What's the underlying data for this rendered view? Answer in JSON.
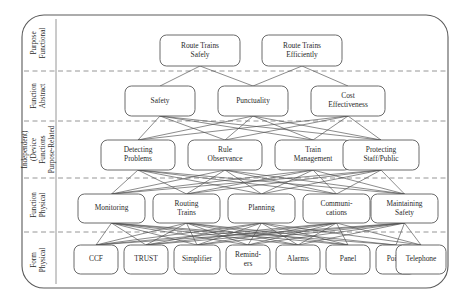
{
  "diagram": {
    "type": "abstraction-hierarchy",
    "frame": {
      "x": 22,
      "y": 15,
      "width": 426,
      "height": 273,
      "radius": 22
    },
    "axis_separator_x": 56,
    "level_dividers_y": [
      71,
      121,
      178,
      232
    ],
    "levels": [
      {
        "id": "functional-purpose",
        "label": "Functional Purpose",
        "label_lines": [
          "Functional",
          "Purpose"
        ],
        "band_top": 15,
        "band_bottom": 71
      },
      {
        "id": "abstract-function",
        "label": "Abstract Function",
        "label_lines": [
          "Abstract",
          "Function"
        ],
        "band_top": 71,
        "band_bottom": 121
      },
      {
        "id": "purpose-related-functions",
        "label": "Purpose-Related Functions (Device Independent)",
        "label_lines": [
          "Purpose-Related",
          "Functions",
          "(Device",
          "Independent)"
        ],
        "band_top": 121,
        "band_bottom": 178
      },
      {
        "id": "physical-function",
        "label": "Physical Function",
        "label_lines": [
          "Physical",
          "Function"
        ],
        "band_top": 178,
        "band_bottom": 232
      },
      {
        "id": "physical-form",
        "label": "Physical Form",
        "label_lines": [
          "Physical",
          "Form"
        ],
        "band_top": 232,
        "band_bottom": 288
      }
    ],
    "nodes": [
      {
        "id": "route-trains-safely",
        "level": 0,
        "lines": [
          "Route Trains",
          "Safely"
        ],
        "x": 160,
        "y": 35,
        "w": 80,
        "h": 31
      },
      {
        "id": "route-trains-efficiently",
        "level": 0,
        "lines": [
          "Route Trains",
          "Efficiently"
        ],
        "x": 262,
        "y": 35,
        "w": 80,
        "h": 31
      },
      {
        "id": "safety",
        "level": 1,
        "lines": [
          "Safety"
        ],
        "x": 125,
        "y": 86,
        "w": 70,
        "h": 30
      },
      {
        "id": "punctuality",
        "level": 1,
        "lines": [
          "Punctuality"
        ],
        "x": 218,
        "y": 86,
        "w": 70,
        "h": 30
      },
      {
        "id": "cost-effectiveness",
        "level": 1,
        "lines": [
          "Cost",
          "Effectiveness"
        ],
        "x": 311,
        "y": 86,
        "w": 74,
        "h": 30
      },
      {
        "id": "detecting-problems",
        "level": 2,
        "lines": [
          "Detecting",
          "Problems"
        ],
        "x": 101,
        "y": 140,
        "w": 74,
        "h": 30
      },
      {
        "id": "rule-observance",
        "level": 2,
        "lines": [
          "Rule",
          "Observance"
        ],
        "x": 188,
        "y": 140,
        "w": 74,
        "h": 30
      },
      {
        "id": "train-management",
        "level": 2,
        "lines": [
          "Train",
          "Management"
        ],
        "x": 275,
        "y": 140,
        "w": 76,
        "h": 30
      },
      {
        "id": "protecting-staff-public",
        "level": 2,
        "lines": [
          "Protecting",
          "Staff/Public"
        ],
        "x": 343,
        "y": 140,
        "w": 76,
        "h": 30
      },
      {
        "id": "monitoring",
        "level": 3,
        "lines": [
          "Monitoring"
        ],
        "x": 78,
        "y": 194,
        "w": 67,
        "h": 29
      },
      {
        "id": "routing-trains",
        "level": 3,
        "lines": [
          "Routing",
          "Trains"
        ],
        "x": 153,
        "y": 194,
        "w": 67,
        "h": 29
      },
      {
        "id": "planning",
        "level": 3,
        "lines": [
          "Planning"
        ],
        "x": 228,
        "y": 194,
        "w": 67,
        "h": 29
      },
      {
        "id": "communications",
        "level": 3,
        "lines": [
          "Communi-",
          "cations"
        ],
        "x": 303,
        "y": 194,
        "w": 67,
        "h": 29
      },
      {
        "id": "maintaining-safety",
        "level": 3,
        "lines": [
          "Maintaining",
          "Safety"
        ],
        "x": 371,
        "y": 194,
        "w": 67,
        "h": 29
      },
      {
        "id": "ccf",
        "level": 4,
        "lines": [
          "CCF"
        ],
        "x": 74,
        "y": 245,
        "w": 44,
        "h": 29
      },
      {
        "id": "trust",
        "level": 4,
        "lines": [
          "TRUST"
        ],
        "x": 124,
        "y": 245,
        "w": 44,
        "h": 29
      },
      {
        "id": "simplifier",
        "level": 4,
        "lines": [
          "Simplifier"
        ],
        "x": 174,
        "y": 245,
        "w": 46,
        "h": 29
      },
      {
        "id": "reminders",
        "level": 4,
        "lines": [
          "Remind-",
          "ers"
        ],
        "x": 226,
        "y": 245,
        "w": 44,
        "h": 29
      },
      {
        "id": "alarms",
        "level": 4,
        "lines": [
          "Alarms"
        ],
        "x": 276,
        "y": 245,
        "w": 44,
        "h": 29
      },
      {
        "id": "panel",
        "level": 4,
        "lines": [
          "Panel"
        ],
        "x": 326,
        "y": 245,
        "w": 44,
        "h": 29
      },
      {
        "id": "points",
        "level": 4,
        "lines": [
          "Points"
        ],
        "x": 376,
        "y": 245,
        "w": 40,
        "h": 29
      },
      {
        "id": "telephone",
        "level": 4,
        "lines": [
          "Telephone"
        ],
        "x": 396,
        "y": 245,
        "w": 50,
        "h": 29
      }
    ],
    "edges": [
      {
        "from": "route-trains-safely",
        "to": "safety"
      },
      {
        "from": "route-trains-safely",
        "to": "punctuality"
      },
      {
        "from": "route-trains-efficiently",
        "to": "punctuality"
      },
      {
        "from": "route-trains-efficiently",
        "to": "cost-effectiveness"
      },
      {
        "from": "safety",
        "to": "detecting-problems"
      },
      {
        "from": "safety",
        "to": "rule-observance"
      },
      {
        "from": "safety",
        "to": "train-management"
      },
      {
        "from": "safety",
        "to": "protecting-staff-public"
      },
      {
        "from": "punctuality",
        "to": "detecting-problems"
      },
      {
        "from": "punctuality",
        "to": "rule-observance"
      },
      {
        "from": "punctuality",
        "to": "train-management"
      },
      {
        "from": "punctuality",
        "to": "protecting-staff-public"
      },
      {
        "from": "cost-effectiveness",
        "to": "detecting-problems"
      },
      {
        "from": "cost-effectiveness",
        "to": "rule-observance"
      },
      {
        "from": "cost-effectiveness",
        "to": "train-management"
      },
      {
        "from": "cost-effectiveness",
        "to": "protecting-staff-public"
      },
      {
        "from": "detecting-problems",
        "to": "monitoring"
      },
      {
        "from": "detecting-problems",
        "to": "routing-trains"
      },
      {
        "from": "detecting-problems",
        "to": "planning"
      },
      {
        "from": "detecting-problems",
        "to": "communications"
      },
      {
        "from": "detecting-problems",
        "to": "maintaining-safety"
      },
      {
        "from": "rule-observance",
        "to": "monitoring"
      },
      {
        "from": "rule-observance",
        "to": "routing-trains"
      },
      {
        "from": "rule-observance",
        "to": "planning"
      },
      {
        "from": "rule-observance",
        "to": "communications"
      },
      {
        "from": "rule-observance",
        "to": "maintaining-safety"
      },
      {
        "from": "train-management",
        "to": "monitoring"
      },
      {
        "from": "train-management",
        "to": "routing-trains"
      },
      {
        "from": "train-management",
        "to": "planning"
      },
      {
        "from": "train-management",
        "to": "communications"
      },
      {
        "from": "train-management",
        "to": "maintaining-safety"
      },
      {
        "from": "protecting-staff-public",
        "to": "monitoring"
      },
      {
        "from": "protecting-staff-public",
        "to": "routing-trains"
      },
      {
        "from": "protecting-staff-public",
        "to": "planning"
      },
      {
        "from": "protecting-staff-public",
        "to": "communications"
      },
      {
        "from": "protecting-staff-public",
        "to": "maintaining-safety"
      },
      {
        "from": "monitoring",
        "to": "ccf"
      },
      {
        "from": "monitoring",
        "to": "trust"
      },
      {
        "from": "monitoring",
        "to": "simplifier"
      },
      {
        "from": "monitoring",
        "to": "reminders"
      },
      {
        "from": "monitoring",
        "to": "alarms"
      },
      {
        "from": "monitoring",
        "to": "panel"
      },
      {
        "from": "monitoring",
        "to": "points"
      },
      {
        "from": "routing-trains",
        "to": "ccf"
      },
      {
        "from": "routing-trains",
        "to": "trust"
      },
      {
        "from": "routing-trains",
        "to": "simplifier"
      },
      {
        "from": "routing-trains",
        "to": "reminders"
      },
      {
        "from": "routing-trains",
        "to": "alarms"
      },
      {
        "from": "routing-trains",
        "to": "panel"
      },
      {
        "from": "routing-trains",
        "to": "points"
      },
      {
        "from": "planning",
        "to": "ccf"
      },
      {
        "from": "planning",
        "to": "trust"
      },
      {
        "from": "planning",
        "to": "simplifier"
      },
      {
        "from": "planning",
        "to": "reminders"
      },
      {
        "from": "planning",
        "to": "alarms"
      },
      {
        "from": "planning",
        "to": "panel"
      },
      {
        "from": "planning",
        "to": "telephone"
      },
      {
        "from": "communications",
        "to": "ccf"
      },
      {
        "from": "communications",
        "to": "trust"
      },
      {
        "from": "communications",
        "to": "simplifier"
      },
      {
        "from": "communications",
        "to": "reminders"
      },
      {
        "from": "communications",
        "to": "alarms"
      },
      {
        "from": "communications",
        "to": "panel"
      },
      {
        "from": "communications",
        "to": "telephone"
      },
      {
        "from": "maintaining-safety",
        "to": "ccf"
      },
      {
        "from": "maintaining-safety",
        "to": "trust"
      },
      {
        "from": "maintaining-safety",
        "to": "simplifier"
      },
      {
        "from": "maintaining-safety",
        "to": "reminders"
      },
      {
        "from": "maintaining-safety",
        "to": "alarms"
      },
      {
        "from": "maintaining-safety",
        "to": "points"
      },
      {
        "from": "maintaining-safety",
        "to": "telephone"
      }
    ]
  }
}
